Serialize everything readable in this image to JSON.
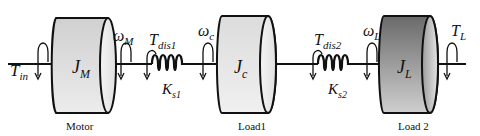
{
  "diagram": {
    "inertias": [
      {
        "id": "motor",
        "symbol": "J",
        "sub": "M",
        "caption": "Motor",
        "fill_light": "#e6e6e6",
        "fill_dark": "#b8b8b8"
      },
      {
        "id": "load1",
        "symbol": "J",
        "sub": "c",
        "caption": "Load1",
        "fill_light": "#eeeeee",
        "fill_dark": "#c4c4c4"
      },
      {
        "id": "load2",
        "symbol": "J",
        "sub": "L",
        "caption": "Load 2",
        "fill_light": "#bdbdbd",
        "fill_dark": "#555555"
      }
    ],
    "springs": [
      {
        "id": "spring1",
        "symbol": "K",
        "sub": "s1",
        "disturbance": {
          "symbol": "T",
          "sub": "dis1"
        }
      },
      {
        "id": "spring2",
        "symbol": "K",
        "sub": "s2",
        "disturbance": {
          "symbol": "T",
          "sub": "dis2"
        }
      }
    ],
    "speeds": [
      {
        "id": "omega_m",
        "symbol": "ω",
        "sub": "M"
      },
      {
        "id": "omega_c",
        "symbol": "ω",
        "sub": "c"
      },
      {
        "id": "omega_l",
        "symbol": "ω",
        "sub": "L"
      }
    ],
    "torques": [
      {
        "id": "t_in",
        "symbol": "T",
        "sub": "in"
      },
      {
        "id": "t_l",
        "symbol": "T",
        "sub": "L"
      }
    ]
  }
}
